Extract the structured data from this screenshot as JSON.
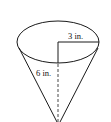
{
  "figure": {
    "shape": "cone",
    "radius_label": "3 in.",
    "height_label": "6 in.",
    "stroke_color": "#1a1a1a"
  }
}
